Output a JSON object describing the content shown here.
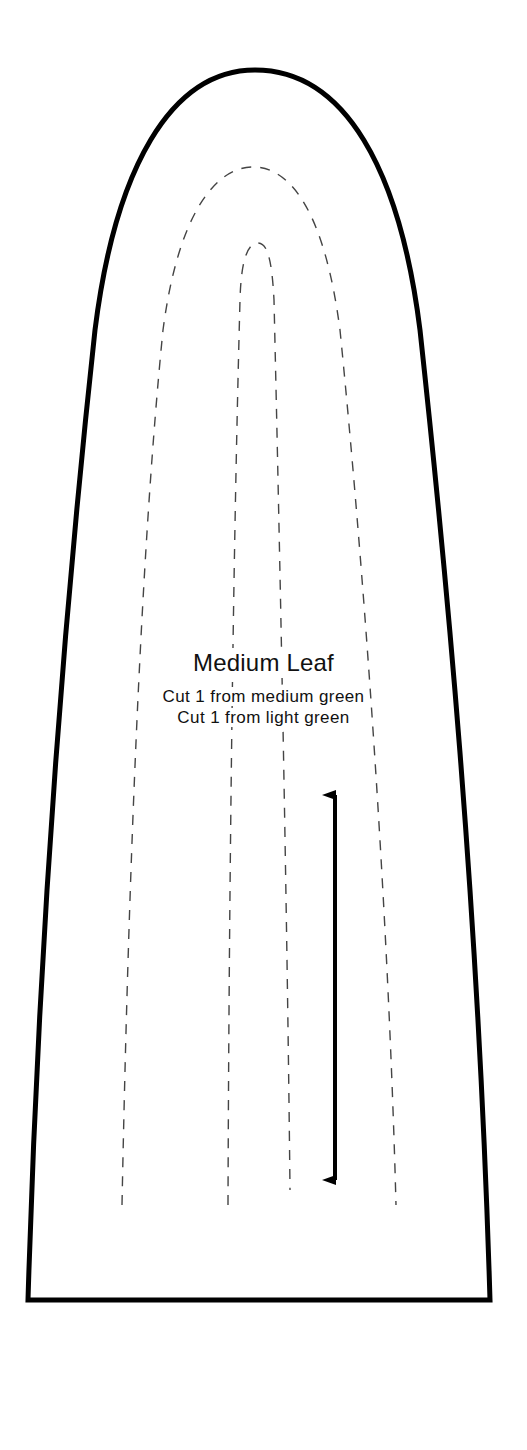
{
  "pattern_piece": {
    "title": "Medium Leaf",
    "instructions": [
      "Cut 1 from medium green",
      "Cut 1 from light green"
    ],
    "shape": "leaf",
    "outline_style": "solid",
    "stitch_lines_style": "dashed",
    "grainline": "vertical double-headed arrow"
  },
  "colors": {
    "background": "#ffffff",
    "outline": "#000000",
    "dashed_lines": "#444444",
    "text": "#111111"
  }
}
